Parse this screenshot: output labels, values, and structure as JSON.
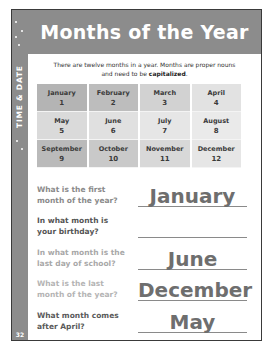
{
  "page": {
    "title": "Months of the Year",
    "side_label": "TIME & DATE",
    "page_number": "32",
    "intro_text_1": "There are twelve months in a year. Months are proper nouns",
    "intro_text_2": "and need to be ",
    "intro_emphasis": "capitalized",
    "intro_end": "."
  },
  "months": [
    {
      "name": "January",
      "num": "1",
      "bg": "#b4b4b4"
    },
    {
      "name": "February",
      "num": "2",
      "bg": "#bdbdbd"
    },
    {
      "name": "March",
      "num": "3",
      "bg": "#d2d2d2"
    },
    {
      "name": "April",
      "num": "4",
      "bg": "#e2e2e2"
    },
    {
      "name": "May",
      "num": "5",
      "bg": "#dadada"
    },
    {
      "name": "June",
      "num": "6",
      "bg": "#e0e0e0"
    },
    {
      "name": "July",
      "num": "7",
      "bg": "#e6e6e6"
    },
    {
      "name": "August",
      "num": "8",
      "bg": "#eaeaea"
    },
    {
      "name": "September",
      "num": "9",
      "bg": "#bababa"
    },
    {
      "name": "October",
      "num": "10",
      "bg": "#c9c9c9"
    },
    {
      "name": "November",
      "num": "11",
      "bg": "#d8d8d8"
    },
    {
      "name": "December",
      "num": "12",
      "bg": "#e6e6e6"
    }
  ],
  "questions": [
    {
      "q": "What is the first month of the year?",
      "a": "January",
      "q_color": "#8a8a8a",
      "a_size": "20px"
    },
    {
      "q": "In what month is your birthday?",
      "a": "",
      "q_color": "#555555",
      "a_size": "20px"
    },
    {
      "q": "In what month is the last day of school?",
      "a": "June",
      "q_color": "#a8a8a8",
      "a_size": "20px"
    },
    {
      "q": "What is the last month of the year?",
      "a": "December",
      "q_color": "#b4b4b4",
      "a_size": "20px"
    },
    {
      "q": "What month comes after April?",
      "a": "May",
      "q_color": "#5a5a5a",
      "a_size": "20px"
    }
  ]
}
